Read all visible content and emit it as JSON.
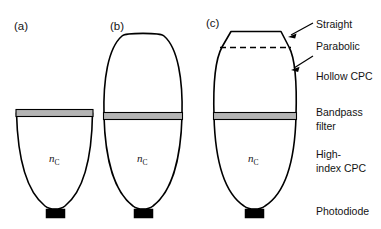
{
  "figure": {
    "background_color": "#ffffff",
    "line_color": "#000000",
    "filter_color": "#b4b4b4",
    "width": 381,
    "height": 229
  },
  "panels": [
    {
      "id": "a",
      "label": "(a)",
      "label_x": 14,
      "label_y": 30,
      "medium_label": "n",
      "medium_subscript": "C",
      "has_hollow_cpc": false,
      "has_straight_section": false,
      "has_parabolic_dashed": false,
      "filter_y": 112,
      "cpc_left": 16,
      "cpc_right": 93,
      "cpc_top": 112,
      "cpc_bottom": 214,
      "photodiode_x": 46,
      "photodiode_y": 209,
      "photodiode_w": 19,
      "photodiode_h": 9
    },
    {
      "id": "b",
      "label": "(b)",
      "label_x": 110,
      "label_y": 30,
      "medium_label": "n",
      "medium_subscript": "C",
      "has_hollow_cpc": true,
      "has_straight_section": false,
      "has_parabolic_dashed": false,
      "filter_y": 116,
      "cpc_left": 103,
      "cpc_right": 183,
      "cpc_top": 31,
      "cpc_bottom": 214,
      "photodiode_x": 134,
      "photodiode_y": 209,
      "photodiode_w": 19,
      "photodiode_h": 9
    },
    {
      "id": "c",
      "label": "(c)",
      "label_x": 206,
      "label_y": 27,
      "medium_label": "n",
      "medium_subscript": "C",
      "has_hollow_cpc": true,
      "has_straight_section": true,
      "has_parabolic_dashed": true,
      "filter_y": 116,
      "cpc_left": 213,
      "cpc_right": 296,
      "cpc_top": 26,
      "cpc_bottom": 214,
      "photodiode_x": 245,
      "photodiode_y": 209,
      "photodiode_w": 19,
      "photodiode_h": 9
    }
  ],
  "annotations": [
    {
      "id": "straight",
      "label": "Straight",
      "text_x": 316,
      "text_y": 28,
      "has_arrow": true,
      "arrow_from_x": 313,
      "arrow_from_y": 24,
      "arrow_to_x": 288,
      "arrow_to_y": 37
    },
    {
      "id": "parabolic",
      "label": "Parabolic",
      "text_x": 316,
      "text_y": 50,
      "has_arrow": true,
      "arrow_from_x": 313,
      "arrow_from_y": 56,
      "arrow_to_x": 291,
      "arrow_to_y": 70
    },
    {
      "id": "hollow-cpc",
      "label": "Hollow CPC",
      "text_x": 316,
      "text_y": 80,
      "has_arrow": false
    },
    {
      "id": "bandpass-filter-line1",
      "label": "Bandpass",
      "text_x": 316,
      "text_y": 116,
      "has_arrow": false
    },
    {
      "id": "bandpass-filter-line2",
      "label": "filter",
      "text_x": 316,
      "text_y": 130,
      "has_arrow": false
    },
    {
      "id": "high-index-cpc-line1",
      "label": "High-",
      "text_x": 316,
      "text_y": 158,
      "has_arrow": false
    },
    {
      "id": "high-index-cpc-line2",
      "label": "index CPC",
      "text_x": 316,
      "text_y": 172,
      "has_arrow": false
    },
    {
      "id": "photodiode",
      "label": "Photodiode",
      "text_x": 316,
      "text_y": 215,
      "has_arrow": false
    }
  ]
}
